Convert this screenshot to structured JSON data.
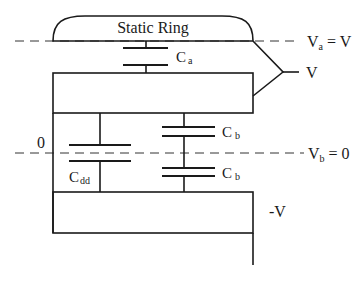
{
  "diagram": {
    "static_ring": {
      "label": "Static Ring"
    },
    "potentials": {
      "va": {
        "symbol": "V",
        "subscript": "a",
        "eq": " = V"
      },
      "vb": {
        "symbol": "V",
        "subscript": "b",
        "eq": " = 0"
      },
      "v_source": "V",
      "neg_v": "-V",
      "zero": "0"
    },
    "capacitors": {
      "ca": {
        "symbol": "C",
        "subscript": "a"
      },
      "cb_upper": {
        "symbol": "C",
        "subscript": "b"
      },
      "cb_lower": {
        "symbol": "C",
        "subscript": "b"
      },
      "cdd": {
        "symbol": "C",
        "subscript": "dd"
      }
    },
    "colors": {
      "line": "#1a1a1a",
      "background": "#ffffff"
    }
  }
}
